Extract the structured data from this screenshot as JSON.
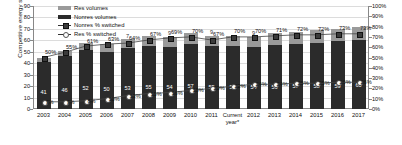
{
  "chart_data": {
    "type": "bar",
    "title": "",
    "xlabel": "",
    "ylabel": "Competitive energy sales (TWh)",
    "ylabel_right": "",
    "ylim": [
      0,
      90
    ],
    "ylim_right": [
      0,
      100
    ],
    "grid": true,
    "legend_position": "top-left",
    "categories": [
      "2003",
      "2004",
      "2005",
      "2006",
      "2007",
      "2008",
      "2009",
      "2010",
      "2011",
      "Current year*",
      "2012",
      "2013",
      "2014",
      "2015",
      "2016",
      "2017"
    ],
    "yticks_left": [
      "0",
      "10",
      "20",
      "30",
      "40",
      "50",
      "60",
      "70",
      "80",
      "90"
    ],
    "yticks_right": [
      "0%",
      "10%",
      "20%",
      "30%",
      "40%",
      "50%",
      "60%",
      "70%",
      "80%",
      "90%",
      "100%"
    ],
    "series": [
      {
        "name": "Nonres volumes",
        "axis": "left",
        "type": "bar",
        "color": "#2b2b2b",
        "values": [
          41,
          46,
          52,
          50,
          53,
          55,
          54,
          57,
          55,
          55,
          54,
          56,
          57,
          58,
          59,
          60
        ],
        "labels": [
          "41",
          "46",
          "52",
          "50",
          "53",
          "55",
          "54",
          "57",
          "55",
          "55",
          "54",
          "56",
          "57",
          "58",
          "59",
          "60"
        ]
      },
      {
        "name": "Res volumes",
        "axis": "left",
        "type": "bar",
        "color": "#9a9a9a",
        "values": [
          4,
          5,
          6,
          7,
          8,
          9,
          9,
          9,
          9,
          9,
          9,
          10,
          10,
          11,
          11,
          12
        ],
        "labels": [
          "",
          "",
          "",
          "",
          "7",
          "",
          "9",
          "",
          "9",
          "",
          "9",
          "",
          "",
          "",
          "",
          ""
        ]
      },
      {
        "name": "Nonres % switched",
        "axis": "right",
        "type": "line",
        "color": "#3a3a3a",
        "values": [
          50,
          55,
          61,
          63,
          64,
          67,
          69,
          70,
          67,
          70,
          70,
          71,
          72,
          72,
          73,
          73
        ],
        "labels": [
          "50%",
          "55%",
          "61%",
          "63%",
          "64%",
          "67%",
          "69%",
          "70%",
          "67%",
          "70%",
          "70%",
          "71%",
          "72%",
          "72%",
          "73%",
          "73%"
        ]
      },
      {
        "name": "Res % switched",
        "axis": "right",
        "type": "line",
        "color": "#ffffff",
        "values": [
          7,
          7,
          8,
          10,
          13,
          15,
          16,
          18,
          20,
          22,
          24,
          24,
          25,
          25,
          26,
          26
        ],
        "labels": [
          "7%",
          "7%",
          "8%",
          "10%",
          "13%",
          "15%",
          "16%",
          "18%",
          "20%",
          "22%",
          "24%",
          "24%",
          "25%",
          "25%",
          "26%",
          "26%"
        ]
      }
    ]
  },
  "legend": {
    "items": [
      {
        "label": "Res volumes"
      },
      {
        "label": "Nonres volumes"
      },
      {
        "label": "Nonres % switched"
      },
      {
        "label": "Res % switched"
      }
    ]
  }
}
